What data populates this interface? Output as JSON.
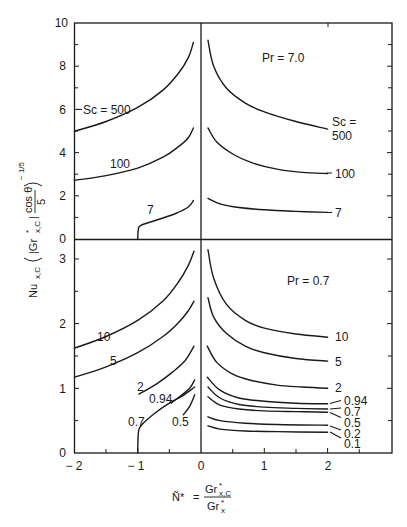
{
  "chart_data": [
    {
      "type": "line",
      "panel": "upper",
      "title": "Pr = 7.0",
      "xlabel": "N* = Gr*x,C / Gr*x",
      "ylabel": "Nu_x,C (|Gr*x,C| cos θ / 5)^(-1/5)",
      "xlim": [
        -2,
        3
      ],
      "ylim": [
        0,
        10
      ],
      "xticks": [
        -2,
        -1,
        0,
        1,
        2
      ],
      "yticks": [
        0,
        2,
        4,
        6,
        8,
        10
      ],
      "grid": false,
      "legend": "inline curve labels",
      "series": [
        {
          "name": "Sc = 500",
          "label": "Sc = 500",
          "branch": "left",
          "points": [
            [
              -2.0,
              5.0
            ],
            [
              -1.5,
              5.45
            ],
            [
              -1.0,
              6.1
            ],
            [
              -0.6,
              6.9
            ],
            [
              -0.35,
              7.7
            ],
            [
              -0.2,
              8.4
            ],
            [
              -0.12,
              9.1
            ]
          ]
        },
        {
          "name": "Sc = 100",
          "label": "100",
          "branch": "left",
          "points": [
            [
              -2.0,
              2.73
            ],
            [
              -1.5,
              2.95
            ],
            [
              -1.0,
              3.3
            ],
            [
              -0.6,
              3.8
            ],
            [
              -0.35,
              4.3
            ],
            [
              -0.2,
              4.7
            ],
            [
              -0.12,
              5.15
            ]
          ]
        },
        {
          "name": "Sc = 7",
          "label": "7",
          "branch": "left",
          "points": [
            [
              -1.0,
              0.0
            ],
            [
              -0.99,
              0.45
            ],
            [
              -0.95,
              0.65
            ],
            [
              -0.7,
              0.9
            ],
            [
              -0.4,
              1.2
            ],
            [
              -0.2,
              1.5
            ],
            [
              -0.12,
              1.8
            ]
          ]
        },
        {
          "name": "Sc = 500",
          "label": "Sc = 500",
          "branch": "right",
          "points": [
            [
              0.11,
              9.2
            ],
            [
              0.2,
              8.0
            ],
            [
              0.4,
              7.0
            ],
            [
              0.7,
              6.3
            ],
            [
              1.0,
              5.9
            ],
            [
              1.5,
              5.45
            ],
            [
              2.0,
              5.1
            ]
          ]
        },
        {
          "name": "Sc = 100",
          "label": "100",
          "branch": "right",
          "points": [
            [
              0.11,
              5.15
            ],
            [
              0.25,
              4.5
            ],
            [
              0.5,
              3.95
            ],
            [
              0.8,
              3.55
            ],
            [
              1.2,
              3.25
            ],
            [
              1.6,
              3.1
            ],
            [
              2.0,
              3.05
            ]
          ]
        },
        {
          "name": "Sc = 7",
          "label": "7",
          "branch": "right",
          "points": [
            [
              0.11,
              1.9
            ],
            [
              0.3,
              1.65
            ],
            [
              0.6,
              1.48
            ],
            [
              1.0,
              1.37
            ],
            [
              1.5,
              1.3
            ],
            [
              2.0,
              1.25
            ]
          ]
        }
      ]
    },
    {
      "type": "line",
      "panel": "lower",
      "title": "Pr = 0.7",
      "xlabel": "N* = Gr*x,C / Gr*x",
      "ylabel": "Nu_x,C (|Gr*x,C| cos θ / 5)^(-1/5)",
      "xlim": [
        -2,
        3
      ],
      "ylim": [
        0,
        3.3
      ],
      "xticks": [
        -2,
        -1,
        0,
        1,
        2
      ],
      "yticks": [
        0,
        1,
        2,
        3
      ],
      "grid": false,
      "legend": "inline curve labels",
      "series": [
        {
          "name": "Sc = 10",
          "label": "10",
          "branch": "left",
          "points": [
            [
              -2.0,
              1.62
            ],
            [
              -1.5,
              1.8
            ],
            [
              -1.0,
              2.05
            ],
            [
              -0.6,
              2.35
            ],
            [
              -0.35,
              2.65
            ],
            [
              -0.2,
              2.9
            ],
            [
              -0.11,
              3.12
            ]
          ]
        },
        {
          "name": "Sc = 5",
          "label": "5",
          "branch": "left",
          "points": [
            [
              -2.0,
              1.17
            ],
            [
              -1.5,
              1.33
            ],
            [
              -1.0,
              1.55
            ],
            [
              -0.6,
              1.8
            ],
            [
              -0.35,
              2.02
            ],
            [
              -0.2,
              2.2
            ],
            [
              -0.11,
              2.35
            ]
          ]
        },
        {
          "name": "Sc = 2",
          "label": "2",
          "branch": "left",
          "points": [
            [
              -0.98,
              0.91
            ],
            [
              -0.7,
              1.07
            ],
            [
              -0.45,
              1.25
            ],
            [
              -0.25,
              1.43
            ],
            [
              -0.11,
              1.65
            ]
          ]
        },
        {
          "name": "Sc = 0.94",
          "label": "0.94",
          "branch": "left",
          "points": [
            [
              -0.47,
              0.77
            ],
            [
              -0.3,
              0.9
            ],
            [
              -0.18,
              1.0
            ],
            [
              -0.1,
              1.13
            ]
          ]
        },
        {
          "name": "Sc = 0.7",
          "label": "0.7",
          "branch": "left",
          "points": [
            [
              -1.0,
              0.0
            ],
            [
              -0.99,
              0.3
            ],
            [
              -0.95,
              0.42
            ],
            [
              -0.75,
              0.6
            ],
            [
              -0.5,
              0.77
            ],
            [
              -0.3,
              0.88
            ],
            [
              -0.1,
              1.02
            ]
          ]
        },
        {
          "name": "Sc = 0.5",
          "label": "0.5",
          "branch": "left",
          "points": [
            [
              -0.28,
              0.59
            ],
            [
              -0.18,
              0.72
            ],
            [
              -0.1,
              0.9
            ]
          ]
        },
        {
          "name": "Sc = 10",
          "label": "10",
          "branch": "right",
          "points": [
            [
              0.11,
              3.14
            ],
            [
              0.2,
              2.7
            ],
            [
              0.4,
              2.3
            ],
            [
              0.7,
              2.05
            ],
            [
              1.0,
              1.93
            ],
            [
              1.5,
              1.84
            ],
            [
              2.0,
              1.79
            ]
          ]
        },
        {
          "name": "Sc = 5",
          "label": "5",
          "branch": "right",
          "points": [
            [
              0.11,
              2.4
            ],
            [
              0.2,
              2.1
            ],
            [
              0.4,
              1.85
            ],
            [
              0.7,
              1.65
            ],
            [
              1.0,
              1.55
            ],
            [
              1.5,
              1.46
            ],
            [
              2.0,
              1.42
            ]
          ]
        },
        {
          "name": "Sc = 2",
          "label": "2",
          "branch": "right",
          "points": [
            [
              0.1,
              1.65
            ],
            [
              0.25,
              1.4
            ],
            [
              0.5,
              1.22
            ],
            [
              0.8,
              1.12
            ],
            [
              1.2,
              1.05
            ],
            [
              1.6,
              1.02
            ],
            [
              2.0,
              1.0
            ]
          ]
        },
        {
          "name": "Sc = 0.94",
          "label": "0.94",
          "branch": "right",
          "points": [
            [
              0.1,
              1.17
            ],
            [
              0.3,
              0.97
            ],
            [
              0.6,
              0.85
            ],
            [
              1.0,
              0.8
            ],
            [
              1.5,
              0.77
            ],
            [
              2.0,
              0.76
            ]
          ]
        },
        {
          "name": "Sc = 0.7",
          "label": "0.7",
          "branch": "right",
          "points": [
            [
              0.11,
              1.02
            ],
            [
              0.3,
              0.85
            ],
            [
              0.6,
              0.75
            ],
            [
              1.0,
              0.71
            ],
            [
              1.5,
              0.69
            ],
            [
              2.0,
              0.68
            ]
          ]
        },
        {
          "name": "Sc = 0.5",
          "label": "0.5",
          "branch": "right",
          "points": [
            [
              0.11,
              0.87
            ],
            [
              0.3,
              0.74
            ],
            [
              0.6,
              0.68
            ],
            [
              1.0,
              0.65
            ],
            [
              1.5,
              0.64
            ],
            [
              2.0,
              0.63
            ]
          ]
        },
        {
          "name": "Sc = 0.2",
          "label": "0.2",
          "branch": "right",
          "points": [
            [
              0.11,
              0.56
            ],
            [
              0.3,
              0.5
            ],
            [
              0.7,
              0.46
            ],
            [
              1.2,
              0.44
            ],
            [
              2.0,
              0.43
            ]
          ]
        },
        {
          "name": "Sc = 0.1",
          "label": "0.1",
          "branch": "right",
          "points": [
            [
              0.11,
              0.42
            ],
            [
              0.3,
              0.37
            ],
            [
              0.7,
              0.34
            ],
            [
              1.2,
              0.33
            ],
            [
              2.0,
              0.32
            ]
          ]
        }
      ]
    }
  ],
  "labels": {
    "upper_title": "Pr = 7.0",
    "lower_title": "Pr = 0.7",
    "upper_yticks": [
      "0",
      "2",
      "4",
      "6",
      "8",
      "10"
    ],
    "lower_yticks": [
      "0",
      "1",
      "2",
      "3"
    ],
    "xticks": [
      "− 2",
      "− 1",
      "0",
      "1",
      "2"
    ],
    "upper_left_sc500": "Sc  =  500",
    "upper_left_sc100": "100",
    "upper_left_sc7": "7",
    "upper_right_sc_head": "Sc  =",
    "upper_right_sc500": "500",
    "upper_right_sc100": "100",
    "upper_right_sc7": "7",
    "lower_left_sc10": "10",
    "lower_left_sc5": "5",
    "lower_left_sc2": "2",
    "lower_left_sc094": "0.94",
    "lower_left_sc07": "0.7",
    "lower_left_sc05": "0.5",
    "lower_right_sc10": "10",
    "lower_right_sc5": "5",
    "lower_right_sc2": "2",
    "lower_right_sc094": "0.94",
    "lower_right_sc07": "0.7",
    "lower_right_sc05": "0.5",
    "lower_right_sc02": "0.2",
    "lower_right_sc01": "0.1",
    "ylabel_nu": "Nu",
    "ylabel_nu_sub": "x,C",
    "ylabel_gr": "|Gr",
    "ylabel_gr_sup": "*",
    "ylabel_gr_sub": "x,C",
    "ylabel_gr_close": "|",
    "ylabel_cos": "cos θ",
    "ylabel_five": "5",
    "ylabel_exp": "− 1/5",
    "xlabel_n": "Ñ*",
    "xlabel_eq": "=",
    "xlabel_num": "Gr",
    "xlabel_num_sup": "*",
    "xlabel_num_sub": "x,C",
    "xlabel_den": "Gr",
    "xlabel_den_sup": "*",
    "xlabel_den_sub": "x"
  },
  "colors": {
    "ink": "#1a1a1a",
    "background": "#ffffff"
  }
}
